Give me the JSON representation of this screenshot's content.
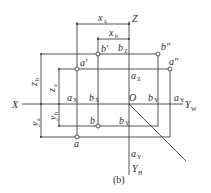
{
  "figure": {
    "caption": "(b)",
    "axes": {
      "x_label": "X",
      "z_label": "Z",
      "origin_label": "O",
      "yw_label": "Y",
      "yw_sub": "W",
      "yh_label": "Y",
      "yh_sub": "H"
    },
    "dimensions": {
      "xa_label": "x",
      "xa_sub": "a",
      "xb_label": "x",
      "xb_sub": "b",
      "za_label": "z",
      "za_sub": "a",
      "zb_label": "z",
      "zb_sub": "b",
      "ya_label": "y",
      "ya_sub": "a",
      "yb_label": "y",
      "yb_sub": "b"
    },
    "points": {
      "a_front": "a'",
      "b_front": "b'",
      "a_side": "a\"",
      "b_side": "b\"",
      "a_top": "a",
      "b_top": "b",
      "ax": "a",
      "ax_sub": "X",
      "bx": "b",
      "bx_sub": "X",
      "az": "a",
      "az_sub": "Z",
      "bz": "b",
      "bz_sub": "Z",
      "ayw": "a",
      "ayw_sub": "Y",
      "byw": "b",
      "byw_sub": "Y",
      "ayh": "a",
      "ayh_sub": "Y",
      "byh": "b",
      "byh_sub": "Y"
    },
    "colors": {
      "line": "#2a2a2a",
      "background": "#ffffff"
    }
  }
}
